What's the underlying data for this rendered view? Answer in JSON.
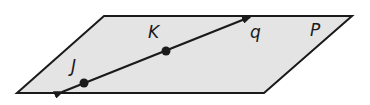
{
  "plane": {
    "label": "P",
    "fill": "#e4e4e4",
    "stroke": "#1a1a1a",
    "corners": [
      [
        104,
        16
      ],
      [
        352,
        16
      ],
      [
        264,
        93
      ],
      [
        17,
        93
      ]
    ]
  },
  "line": {
    "label": "q",
    "stroke": "#1a1a1a",
    "start": [
      60,
      93
    ],
    "end": [
      252,
      16
    ],
    "arrows": "both"
  },
  "points": [
    {
      "label": "K",
      "x": 166,
      "y": 51
    },
    {
      "label": "J",
      "x": 84,
      "y": 83
    }
  ],
  "labels": {
    "K": "K",
    "J": "J",
    "q": "q",
    "P": "P"
  }
}
